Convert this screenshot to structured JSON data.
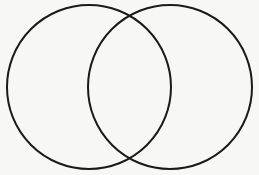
{
  "diagram": {
    "type": "venn",
    "background": "#f7f7f5",
    "stroke_color": "#1a1a1a",
    "stroke_width": 2,
    "circles": [
      {
        "id": "left",
        "cx": 89,
        "cy": 87,
        "r": 82,
        "label": ""
      },
      {
        "id": "right",
        "cx": 170,
        "cy": 87,
        "r": 82,
        "label": ""
      }
    ],
    "intersections": [
      {
        "x": 130,
        "y": 15
      },
      {
        "x": 130,
        "y": 159
      }
    ]
  }
}
